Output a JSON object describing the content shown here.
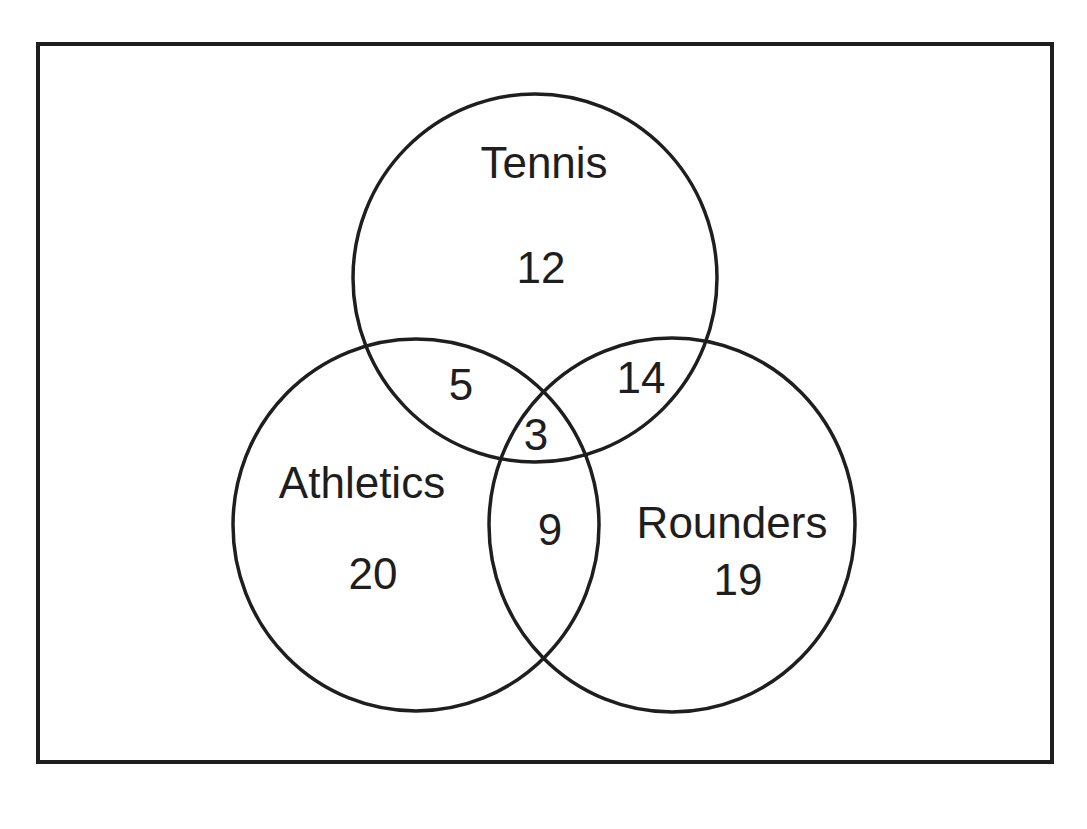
{
  "diagram": {
    "type": "venn",
    "universal_set": {
      "label": "",
      "border_color": "#1e1e1e"
    },
    "sets": [
      {
        "id": "tennis",
        "label": "Tennis"
      },
      {
        "id": "athletics",
        "label": "Athletics"
      },
      {
        "id": "rounders",
        "label": "Rounders"
      }
    ],
    "regions": {
      "tennis_only": "12",
      "athletics_only": "20",
      "rounders_only": "19",
      "tennis_athletics_only": "5",
      "tennis_rounders_only": "14",
      "athletics_rounders_only": "9",
      "all_three": "3"
    },
    "colors": {
      "stroke": "#1e1e1e",
      "text": "#1e1e1e",
      "background": "#ffffff"
    }
  }
}
